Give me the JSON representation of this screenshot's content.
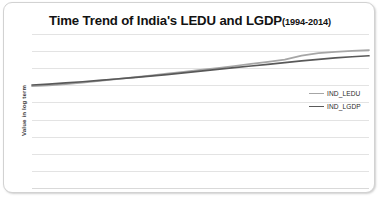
{
  "card": {
    "border_color": "#d2d2d2",
    "background": "#ffffff"
  },
  "title": {
    "main": "Time Trend of India's LEDU and LGDP",
    "years": "(1994-2014)"
  },
  "axes": {
    "y_title": "Value in log term",
    "x_title": ""
  },
  "legend": {
    "items": [
      {
        "label": "IND_LEDU",
        "color": "#a6a6a6"
      },
      {
        "label": "IND_LGDP",
        "color": "#595959"
      }
    ]
  },
  "chart_data": {
    "type": "line",
    "xlabel": "",
    "ylabel": "Value in log term",
    "grid": true,
    "legend_position": "right",
    "x": [
      1994,
      1995,
      1996,
      1997,
      1998,
      1999,
      2000,
      2001,
      2002,
      2003,
      2004,
      2005,
      2006,
      2007,
      2008,
      2009,
      2010,
      2011,
      2012,
      2013,
      2014
    ],
    "xlim": [
      1994,
      2014
    ],
    "ylim": [
      0,
      9
    ],
    "y_gridline_values": [
      9,
      8,
      7,
      6,
      5,
      4,
      3,
      2,
      1,
      0
    ],
    "y_tick_labels_visible": false,
    "x_tick_labels_visible": false,
    "series": [
      {
        "name": "IND_LEDU",
        "color": "#a6a6a6",
        "values": [
          5.95,
          5.99,
          6.07,
          6.16,
          6.26,
          6.36,
          6.46,
          6.57,
          6.68,
          6.79,
          6.9,
          7.01,
          7.13,
          7.25,
          7.37,
          7.5,
          7.74,
          7.88,
          7.95,
          8.01,
          8.06
        ]
      },
      {
        "name": "IND_LGDP",
        "color": "#595959",
        "values": [
          6.02,
          6.07,
          6.14,
          6.21,
          6.29,
          6.37,
          6.45,
          6.54,
          6.63,
          6.73,
          6.83,
          6.93,
          7.03,
          7.13,
          7.23,
          7.33,
          7.43,
          7.52,
          7.6,
          7.67,
          7.73
        ]
      }
    ]
  }
}
